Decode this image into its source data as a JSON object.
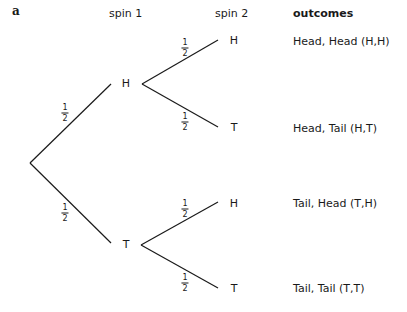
{
  "panel_label": "a",
  "headers": {
    "spin1": "spin 1",
    "spin2": "spin 2",
    "outcomes": "outcomes"
  },
  "tree": {
    "root": {
      "x": 30,
      "y": 163
    },
    "level1": [
      {
        "label": "H",
        "x": 126,
        "y": 83,
        "line_end": [
          111,
          84
        ],
        "prob": {
          "num": "1",
          "den": "2",
          "x": 65,
          "y": 113
        }
      },
      {
        "label": "T",
        "x": 126,
        "y": 244,
        "line_end": [
          111,
          243
        ],
        "prob": {
          "num": "1",
          "den": "2",
          "x": 65,
          "y": 213
        }
      }
    ],
    "level2": [
      {
        "parent": 0,
        "label": "H",
        "x": 234,
        "y": 40,
        "line_start": [
          142,
          84
        ],
        "line_end": [
          218,
          40
        ],
        "prob": {
          "num": "1",
          "den": "2",
          "x": 185,
          "y": 48
        }
      },
      {
        "parent": 0,
        "label": "T",
        "x": 234,
        "y": 127,
        "line_start": [
          142,
          84
        ],
        "line_end": [
          218,
          127
        ],
        "prob": {
          "num": "1",
          "den": "2",
          "x": 185,
          "y": 122
        }
      },
      {
        "parent": 1,
        "label": "H",
        "x": 234,
        "y": 203,
        "line_start": [
          141,
          245
        ],
        "line_end": [
          218,
          202
        ],
        "prob": {
          "num": "1",
          "den": "2",
          "x": 185,
          "y": 209
        }
      },
      {
        "parent": 1,
        "label": "T",
        "x": 234,
        "y": 288,
        "line_start": [
          141,
          245
        ],
        "line_end": [
          218,
          288
        ],
        "prob": {
          "num": "1",
          "den": "2",
          "x": 185,
          "y": 283
        }
      }
    ]
  },
  "outcomes": [
    {
      "text": "Head, Head (H,H)",
      "y": 40
    },
    {
      "text": "Head, Tail (H,T)",
      "y": 127
    },
    {
      "text": "Tail, Head (T,H)",
      "y": 203
    },
    {
      "text": "Tail, Tail (T,T)",
      "y": 288
    }
  ],
  "colors": {
    "line": "#1a1a1a",
    "text": "#1a1a1a",
    "background": "#ffffff"
  }
}
